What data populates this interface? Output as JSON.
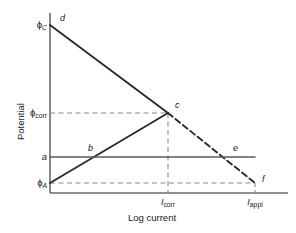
{
  "chart_data": {
    "type": "line",
    "title": "",
    "xlabel": "Log current",
    "ylabel": "Potential",
    "grid": false,
    "legend": false,
    "xticks": [
      {
        "label": "I",
        "sub": "corr",
        "x": 168
      },
      {
        "label": "I",
        "sub": "appl",
        "x": 255
      }
    ],
    "yticks": [
      {
        "label": "ϕ",
        "sub": "C",
        "italic_sub": true,
        "y": 25
      },
      {
        "label": "ϕ",
        "sub": "corr",
        "italic_sub": false,
        "y": 113
      },
      {
        "label": "a",
        "sub": "",
        "italic_sub": false,
        "y": 157
      },
      {
        "label": "ϕ",
        "sub": "A",
        "italic_sub": true,
        "y": 183
      }
    ],
    "axes": {
      "x_axis_y": 193,
      "y_axis_x": 50,
      "y_axis_top": 13,
      "x_axis_right": 288
    },
    "points": [
      {
        "name": "d",
        "x": 50,
        "y": 25,
        "label_dx": 10,
        "label_dy": -3
      },
      {
        "name": "c",
        "x": 168,
        "y": 113,
        "label_dx": 7,
        "label_dy": -4
      },
      {
        "name": "b",
        "x": 88,
        "y": 157,
        "label_dx": 0,
        "label_dy": -5
      },
      {
        "name": "e",
        "x": 228,
        "y": 157,
        "label_dx": 5,
        "label_dy": -5
      },
      {
        "name": "f",
        "x": 255,
        "y": 183,
        "label_dx": 7,
        "label_dy": 0
      }
    ],
    "series": [
      {
        "name": "cathodic-branch-solid",
        "style": "solid",
        "from": {
          "x": 50,
          "y": 25
        },
        "to": {
          "x": 168,
          "y": 113
        }
      },
      {
        "name": "cathodic-branch-dashed",
        "style": "dashed",
        "from": {
          "x": 168,
          "y": 113
        },
        "to": {
          "x": 255,
          "y": 183
        }
      },
      {
        "name": "anodic-branch-solid",
        "style": "solid",
        "from": {
          "x": 50,
          "y": 183
        },
        "to": {
          "x": 168,
          "y": 113
        }
      },
      {
        "name": "applied-current-line",
        "style": "solid",
        "from": {
          "x": 50,
          "y": 157
        },
        "to": {
          "x": 255,
          "y": 157
        }
      }
    ],
    "guides": [
      {
        "name": "phi-corr-guide",
        "style": "dashed",
        "from": {
          "x": 50,
          "y": 113
        },
        "to": {
          "x": 168,
          "y": 113
        }
      },
      {
        "name": "phi-a-guide",
        "style": "dashed",
        "from": {
          "x": 50,
          "y": 183
        },
        "to": {
          "x": 255,
          "y": 183
        }
      },
      {
        "name": "i-corr-guide",
        "style": "dashed",
        "from": {
          "x": 168,
          "y": 113
        },
        "to": {
          "x": 168,
          "y": 193
        }
      },
      {
        "name": "i-appl-tick",
        "style": "dashed",
        "from": {
          "x": 255,
          "y": 183
        },
        "to": {
          "x": 255,
          "y": 193
        }
      }
    ],
    "colors": {
      "line": "#2b2b2b",
      "axis": "#6b6b6b",
      "guide": "#8a8a8a",
      "text": "#1a1a1a",
      "background": "#ffffff"
    }
  }
}
